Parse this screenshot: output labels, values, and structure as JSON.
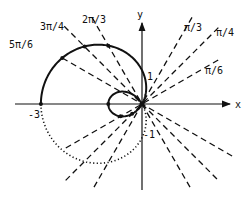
{
  "diagram": {
    "type": "polar-curve",
    "axes": {
      "x_label": "x",
      "y_label": "y",
      "tick_labels": {
        "neg3": "-3",
        "pos1": "1",
        "neg1": "-1"
      }
    },
    "rays": [
      {
        "id": "pi6",
        "label": "π/6",
        "angle_deg": 30
      },
      {
        "id": "pi4",
        "label": "π/4",
        "angle_deg": 45
      },
      {
        "id": "pi3",
        "label": "π/3",
        "angle_deg": 60
      },
      {
        "id": "2pi3",
        "label": "2π/3",
        "angle_deg": 120
      },
      {
        "id": "3pi4",
        "label": "3π/4",
        "angle_deg": 135
      },
      {
        "id": "5pi6",
        "label": "5π/6",
        "angle_deg": 150
      }
    ],
    "colors": {
      "ink": "#111111",
      "background": "#ffffff"
    }
  }
}
